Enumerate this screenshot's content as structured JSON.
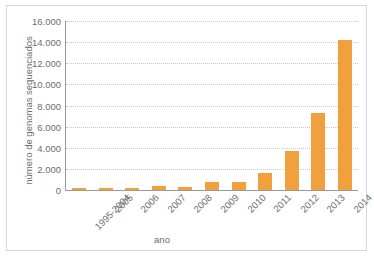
{
  "chart_data": {
    "type": "bar",
    "title": "",
    "xlabel": "ano",
    "ylabel": "número de genomas sequenciados",
    "categories": [
      "1995-2004",
      "2005",
      "2006",
      "2007",
      "2008",
      "2009",
      "2010",
      "2011",
      "2012",
      "2013",
      "2014"
    ],
    "values": [
      180,
      90,
      200,
      350,
      330,
      720,
      750,
      1600,
      3700,
      7300,
      14200
    ],
    "ylim": [
      0,
      16000
    ],
    "ytick_values": [
      0,
      2000,
      4000,
      6000,
      8000,
      10000,
      12000,
      14000,
      16000
    ],
    "ytick_labels": [
      "0",
      "2.000",
      "4.000",
      "6.000",
      "8.000",
      "10.000",
      "12.000",
      "14.000",
      "16.000"
    ],
    "grid": true,
    "legend": false,
    "legend_position": "none",
    "series": [
      {
        "name": "genomas sequenciados",
        "values": [
          180,
          90,
          200,
          350,
          330,
          720,
          750,
          1600,
          3700,
          7300,
          14200
        ]
      }
    ],
    "colors": {
      "bar": "#f0a03c",
      "gridline": "#c9c9c9",
      "axis": "#9a9a9a",
      "text": "#6d6d6d",
      "frame": "#d8d8d8",
      "background": "#ffffff"
    }
  }
}
